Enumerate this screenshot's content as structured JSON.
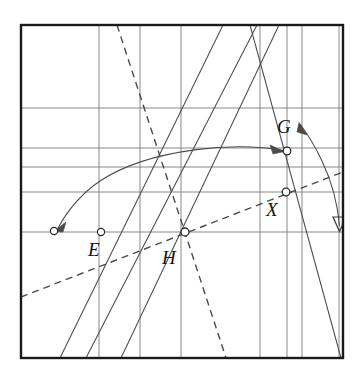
{
  "figure": {
    "name": "geometry-construction-diagram",
    "background_color": "#ffffff",
    "stroke_color": "#3a3a3a",
    "frame_color": "#1a1a1a",
    "grid_color": "#777777",
    "frame": {
      "x": 21,
      "y": 25,
      "width": 322,
      "height": 333
    },
    "grid": {
      "vertical_x": [
        99,
        140,
        181,
        260,
        287,
        302,
        339
      ],
      "horizontal_y": [
        108,
        148,
        167,
        192,
        232
      ]
    },
    "points": [
      {
        "id": "E",
        "label": "E",
        "cx": 101,
        "cy": 232,
        "label_x": 88,
        "label_y": 240
      },
      {
        "id": "H",
        "label": "H",
        "cx": 185,
        "cy": 232,
        "label_x": 162,
        "label_y": 248
      },
      {
        "id": "G",
        "label": "G",
        "cx": 287,
        "cy": 151,
        "label_x": 277,
        "label_y": 117
      },
      {
        "id": "X",
        "label": "X",
        "cx": 286,
        "cy": 192,
        "label_x": 266,
        "label_y": 200
      },
      {
        "id": "arrow-target",
        "label": "",
        "cx": 54,
        "cy": 231,
        "label_x": 0,
        "label_y": 0
      }
    ],
    "lines": [
      {
        "id": "line-steep-a",
        "style": "solid",
        "x1": 223,
        "y1": 25,
        "x2": 60,
        "y2": 358
      },
      {
        "id": "line-steep-b",
        "style": "solid",
        "x1": 257,
        "y1": 25,
        "x2": 86,
        "y2": 358
      },
      {
        "id": "line-rising-through-H",
        "style": "solid",
        "x1": 279,
        "y1": 25,
        "x2": 121,
        "y2": 358
      },
      {
        "id": "line-descending-right",
        "style": "solid",
        "x1": 250,
        "y1": 25,
        "x2": 341,
        "y2": 358
      },
      {
        "id": "line-dashed-steep",
        "style": "dashed",
        "x1": 117,
        "y1": 25,
        "x2": 225,
        "y2": 357
      },
      {
        "id": "line-dashed-shallow",
        "style": "dashed",
        "x1": 21,
        "y1": 297,
        "x2": 343,
        "y2": 172
      }
    ],
    "curves": [
      {
        "id": "arc-E-to-G",
        "style": "solid-arrow",
        "description": "arc from G curving left to arrowhead"
      },
      {
        "id": "arc-G-to-right-border",
        "style": "solid-arrow",
        "description": "arc from lower-right curving up to arrowhead near G"
      }
    ]
  }
}
